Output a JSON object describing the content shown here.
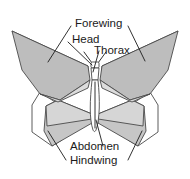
{
  "diagram": {
    "background_color": "#ffffff",
    "line_color": "#4a4a4a",
    "label_color": "#1b1b1b",
    "fill_dark": "#b9b9b9",
    "fill_mid": "#cfcfcf",
    "fill_light": "#e2e2e2",
    "fill_white": "#ffffff",
    "labels": [
      {
        "id": "forewing",
        "text": "Forewing",
        "x": 75,
        "y": 27
      },
      {
        "id": "head",
        "text": "Head",
        "x": 72,
        "y": 43
      },
      {
        "id": "thorax",
        "text": "Thorax",
        "x": 94,
        "y": 54
      },
      {
        "id": "abdomen",
        "text": "Abdomen",
        "x": 70,
        "y": 150
      },
      {
        "id": "hindwing",
        "text": "Hindwing",
        "x": 70,
        "y": 164
      }
    ],
    "parts": [
      {
        "id": "forewing-left",
        "name": "left forewing"
      },
      {
        "id": "forewing-right",
        "name": "right forewing"
      },
      {
        "id": "hindwing-left",
        "name": "left hindwing"
      },
      {
        "id": "hindwing-right",
        "name": "right hindwing"
      },
      {
        "id": "head",
        "name": "head"
      },
      {
        "id": "thorax",
        "name": "thorax"
      },
      {
        "id": "abdomen",
        "name": "abdomen"
      },
      {
        "id": "antenna-left",
        "name": "left antenna"
      },
      {
        "id": "antenna-right",
        "name": "right antenna"
      }
    ]
  }
}
